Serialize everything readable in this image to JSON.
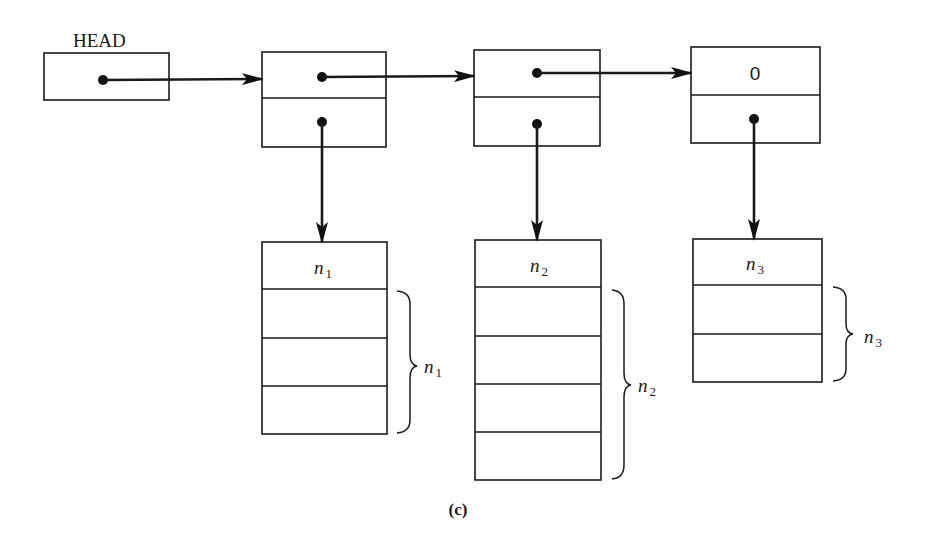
{
  "diagram": {
    "head_label": "HEAD",
    "caption": "(c)",
    "nodes": [
      {
        "id": "node-1",
        "next_field": "pointer",
        "data_field": "pointer"
      },
      {
        "id": "node-2",
        "next_field": "pointer",
        "data_field": "pointer"
      },
      {
        "id": "node-3",
        "next_field": "0",
        "data_field": "pointer"
      }
    ],
    "null_value": "0",
    "blocks": [
      {
        "header": "n",
        "subscript": "1",
        "brace_label": "n",
        "brace_subscript": "1",
        "slots": 3
      },
      {
        "header": "n",
        "subscript": "2",
        "brace_label": "n",
        "brace_subscript": "2",
        "slots": 4
      },
      {
        "header": "n",
        "subscript": "3",
        "brace_label": "n",
        "brace_subscript": "3",
        "slots": 2
      }
    ]
  }
}
